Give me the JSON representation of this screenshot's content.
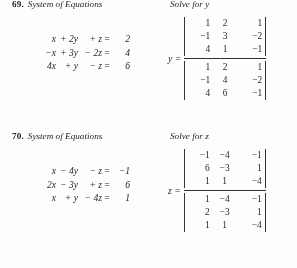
{
  "page": {
    "background_color": "#fdfdfb",
    "text_color": "#1d1d1d"
  },
  "problems": [
    {
      "number": "69.",
      "title": "System of Equations",
      "equations": [
        {
          "term1": "x",
          "term2": "+ 2y",
          "term3": "+  z",
          "eq": "=",
          "rhs": "2"
        },
        {
          "term1": "−x",
          "term2": "+ 3y",
          "term3": "− 2z",
          "eq": "=",
          "rhs": "4"
        },
        {
          "term1": "4x",
          "term2": "+  y",
          "term3": "−  z",
          "eq": "=",
          "rhs": "6"
        }
      ],
      "solve_label": "Solve for y",
      "variable": "y =",
      "numerator": [
        [
          "1",
          "2",
          "1"
        ],
        [
          "−1",
          "3",
          "−2"
        ],
        [
          "4",
          "1",
          "−1"
        ]
      ],
      "denominator": [
        [
          "1",
          "2",
          "1"
        ],
        [
          "−1",
          "4",
          "−2"
        ],
        [
          "4",
          "6",
          "−1"
        ]
      ]
    },
    {
      "number": "70.",
      "title": "System of Equations",
      "equations": [
        {
          "term1": "x",
          "term2": "− 4y",
          "term3": "−  z",
          "eq": "=",
          "rhs": "−1"
        },
        {
          "term1": "2x",
          "term2": "− 3y",
          "term3": "+  z",
          "eq": "=",
          "rhs": "6"
        },
        {
          "term1": "x",
          "term2": "+  y",
          "term3": "− 4z",
          "eq": "=",
          "rhs": "1"
        }
      ],
      "solve_label": "Solve for z",
      "variable": "z =",
      "numerator": [
        [
          "−1",
          "−4",
          "−1"
        ],
        [
          "6",
          "−3",
          "1"
        ],
        [
          "1",
          "1",
          "−4"
        ]
      ],
      "denominator": [
        [
          "1",
          "−4",
          "−1"
        ],
        [
          "2",
          "−3",
          "1"
        ],
        [
          "1",
          "1",
          "−4"
        ]
      ]
    }
  ]
}
